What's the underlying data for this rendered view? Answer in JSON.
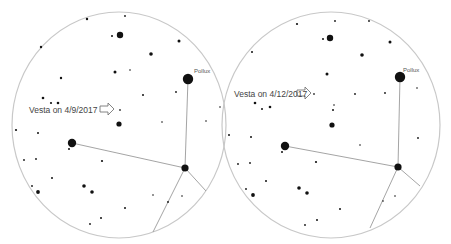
{
  "charts": [
    {
      "id": "left",
      "vesta_label": "Vesta on 4/9/2017",
      "pollux_label": "Pollux",
      "circle": {
        "cx": 119,
        "cy": 125,
        "rx": 107,
        "ry": 113
      },
      "vesta_label_pos": {
        "x": 29,
        "y": 106
      },
      "arrow": {
        "x": 100,
        "y": 104
      },
      "vesta_point": {
        "x": 120,
        "y": 110
      },
      "pollux_label_pos": {
        "x": 194,
        "y": 68
      },
      "lines": [
        [
          [
            188,
            79
          ],
          [
            185,
            168
          ]
        ],
        [
          [
            72,
            143
          ],
          [
            185,
            168
          ]
        ],
        [
          [
            185,
            168
          ],
          [
            206,
            191
          ]
        ],
        [
          [
            185,
            168
          ],
          [
            153,
            232
          ]
        ]
      ],
      "stars": [
        {
          "x": 188,
          "y": 79,
          "r": 5.2
        },
        {
          "x": 120,
          "y": 35,
          "r": 3.2
        },
        {
          "x": 72,
          "y": 143,
          "r": 4.2
        },
        {
          "x": 185,
          "y": 168,
          "r": 3.6
        },
        {
          "x": 119,
          "y": 124,
          "r": 2.6
        },
        {
          "x": 151,
          "y": 54,
          "r": 1.8
        },
        {
          "x": 179,
          "y": 41,
          "r": 1.5
        },
        {
          "x": 115,
          "y": 72,
          "r": 1.5
        },
        {
          "x": 61,
          "y": 78,
          "r": 1.2
        },
        {
          "x": 87,
          "y": 19,
          "r": 1.2
        },
        {
          "x": 41,
          "y": 47,
          "r": 1.2
        },
        {
          "x": 112,
          "y": 36,
          "r": 1.0
        },
        {
          "x": 125,
          "y": 16,
          "r": 0.9
        },
        {
          "x": 43,
          "y": 98,
          "r": 1.3
        },
        {
          "x": 51,
          "y": 103,
          "r": 1.1
        },
        {
          "x": 58,
          "y": 103,
          "r": 1.3
        },
        {
          "x": 16,
          "y": 130,
          "r": 1.1
        },
        {
          "x": 38,
          "y": 133,
          "r": 1.0
        },
        {
          "x": 69,
          "y": 149,
          "r": 1.0
        },
        {
          "x": 102,
          "y": 161,
          "r": 1.1
        },
        {
          "x": 52,
          "y": 178,
          "r": 1.0
        },
        {
          "x": 84,
          "y": 186,
          "r": 1.8
        },
        {
          "x": 92,
          "y": 192,
          "r": 1.8
        },
        {
          "x": 38,
          "y": 192,
          "r": 1.9
        },
        {
          "x": 32,
          "y": 186,
          "r": 0.9
        },
        {
          "x": 24,
          "y": 160,
          "r": 0.9
        },
        {
          "x": 36,
          "y": 159,
          "r": 0.9
        },
        {
          "x": 125,
          "y": 208,
          "r": 1.0
        },
        {
          "x": 101,
          "y": 218,
          "r": 1.0
        },
        {
          "x": 90,
          "y": 224,
          "r": 0.9
        },
        {
          "x": 168,
          "y": 202,
          "r": 0.9
        },
        {
          "x": 143,
          "y": 95,
          "r": 1.0
        },
        {
          "x": 176,
          "y": 92,
          "r": 0.9
        },
        {
          "x": 130,
          "y": 70,
          "r": 0.8
        },
        {
          "x": 162,
          "y": 122,
          "r": 0.8
        },
        {
          "x": 206,
          "y": 121,
          "r": 0.8
        },
        {
          "x": 220,
          "y": 107,
          "r": 0.8
        },
        {
          "x": 153,
          "y": 195,
          "r": 0.8
        },
        {
          "x": 182,
          "y": 196,
          "r": 0.8
        }
      ]
    },
    {
      "id": "right",
      "vesta_label": "Vesta on 4/12/2017",
      "pollux_label": "Pollux",
      "circle": {
        "cx": 331,
        "cy": 125,
        "rx": 109,
        "ry": 113
      },
      "vesta_label_pos": {
        "x": 234,
        "y": 90
      },
      "arrow": {
        "x": 297,
        "y": 88
      },
      "vesta_point": {
        "x": 314,
        "y": 94
      },
      "pollux_label_pos": {
        "x": 403,
        "y": 67
      },
      "lines": [
        [
          [
            400,
            77
          ],
          [
            398,
            167
          ]
        ],
        [
          [
            285,
            146
          ],
          [
            398,
            167
          ]
        ],
        [
          [
            398,
            167
          ],
          [
            420,
            186
          ]
        ],
        [
          [
            398,
            167
          ],
          [
            370,
            228
          ]
        ]
      ],
      "stars": [
        {
          "x": 400,
          "y": 77,
          "r": 5.2
        },
        {
          "x": 330,
          "y": 38,
          "r": 3.2
        },
        {
          "x": 285,
          "y": 146,
          "r": 4.2
        },
        {
          "x": 398,
          "y": 167,
          "r": 3.6
        },
        {
          "x": 332,
          "y": 125,
          "r": 2.6
        },
        {
          "x": 362,
          "y": 55,
          "r": 1.8
        },
        {
          "x": 390,
          "y": 42,
          "r": 1.5
        },
        {
          "x": 327,
          "y": 74,
          "r": 1.5
        },
        {
          "x": 297,
          "y": 24,
          "r": 1.1
        },
        {
          "x": 335,
          "y": 21,
          "r": 0.9
        },
        {
          "x": 369,
          "y": 21,
          "r": 0.9
        },
        {
          "x": 252,
          "y": 52,
          "r": 1.0
        },
        {
          "x": 323,
          "y": 39,
          "r": 1.0
        },
        {
          "x": 255,
          "y": 103,
          "r": 1.3
        },
        {
          "x": 262,
          "y": 109,
          "r": 1.0
        },
        {
          "x": 270,
          "y": 107,
          "r": 1.3
        },
        {
          "x": 229,
          "y": 135,
          "r": 1.0
        },
        {
          "x": 251,
          "y": 137,
          "r": 1.0
        },
        {
          "x": 282,
          "y": 152,
          "r": 1.0
        },
        {
          "x": 316,
          "y": 162,
          "r": 1.1
        },
        {
          "x": 266,
          "y": 181,
          "r": 1.0
        },
        {
          "x": 299,
          "y": 188,
          "r": 1.8
        },
        {
          "x": 307,
          "y": 193,
          "r": 1.8
        },
        {
          "x": 253,
          "y": 195,
          "r": 1.9
        },
        {
          "x": 246,
          "y": 189,
          "r": 0.9
        },
        {
          "x": 238,
          "y": 164,
          "r": 0.9
        },
        {
          "x": 250,
          "y": 163,
          "r": 0.9
        },
        {
          "x": 340,
          "y": 209,
          "r": 1.0
        },
        {
          "x": 317,
          "y": 220,
          "r": 1.0
        },
        {
          "x": 305,
          "y": 225,
          "r": 0.9
        },
        {
          "x": 333,
          "y": 110,
          "r": 1.0
        },
        {
          "x": 334,
          "y": 105,
          "r": 0.8
        },
        {
          "x": 355,
          "y": 94,
          "r": 0.9
        },
        {
          "x": 385,
          "y": 93,
          "r": 0.9
        },
        {
          "x": 418,
          "y": 138,
          "r": 0.9
        },
        {
          "x": 417,
          "y": 88,
          "r": 0.8
        },
        {
          "x": 383,
          "y": 201,
          "r": 0.8
        },
        {
          "x": 395,
          "y": 196,
          "r": 0.8
        },
        {
          "x": 360,
          "y": 145,
          "r": 0.8
        }
      ]
    }
  ],
  "colors": {
    "circle": "#c8c8c8",
    "line": "#9a9a9a",
    "star": "#111111",
    "label": "#444444",
    "arrow": "#777777",
    "background": "#ffffff"
  }
}
